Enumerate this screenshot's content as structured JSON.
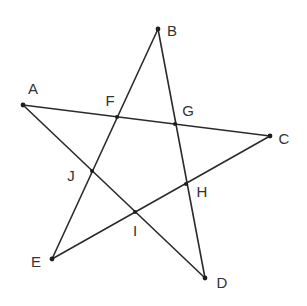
{
  "figure": {
    "type": "pentagram",
    "stroke_color": "#2b2b2b",
    "label_color": "#333333"
  },
  "vertices": [
    {
      "id": "A",
      "label": "A",
      "x": 23,
      "y": 105,
      "lx": 33,
      "ly": 94
    },
    {
      "id": "B",
      "label": "B",
      "x": 158,
      "y": 29,
      "lx": 172,
      "ly": 36
    },
    {
      "id": "C",
      "label": "C",
      "x": 270,
      "y": 136,
      "lx": 284,
      "ly": 144
    },
    {
      "id": "D",
      "label": "D",
      "x": 205,
      "y": 278,
      "lx": 222,
      "ly": 288
    },
    {
      "id": "E",
      "label": "E",
      "x": 52,
      "y": 259,
      "lx": 36,
      "ly": 267
    }
  ],
  "intersections": [
    {
      "id": "F",
      "label": "F",
      "x": 117,
      "y": 117,
      "lx": 110,
      "ly": 106
    },
    {
      "id": "G",
      "label": "G",
      "x": 175,
      "y": 124,
      "lx": 188,
      "ly": 116
    },
    {
      "id": "H",
      "label": "H",
      "x": 186,
      "y": 184,
      "lx": 202,
      "ly": 197
    },
    {
      "id": "I",
      "label": "I",
      "x": 135,
      "y": 212,
      "lx": 135,
      "ly": 236
    },
    {
      "id": "J",
      "label": "J",
      "x": 92,
      "y": 171,
      "lx": 71,
      "ly": 181
    }
  ],
  "segments": [
    {
      "name": "segment-AC",
      "from": "A",
      "to": "C"
    },
    {
      "name": "segment-CE",
      "from": "C",
      "to": "E"
    },
    {
      "name": "segment-EB",
      "from": "E",
      "to": "B"
    },
    {
      "name": "segment-BD",
      "from": "B",
      "to": "D"
    },
    {
      "name": "segment-DA",
      "from": "D",
      "to": "A"
    }
  ]
}
